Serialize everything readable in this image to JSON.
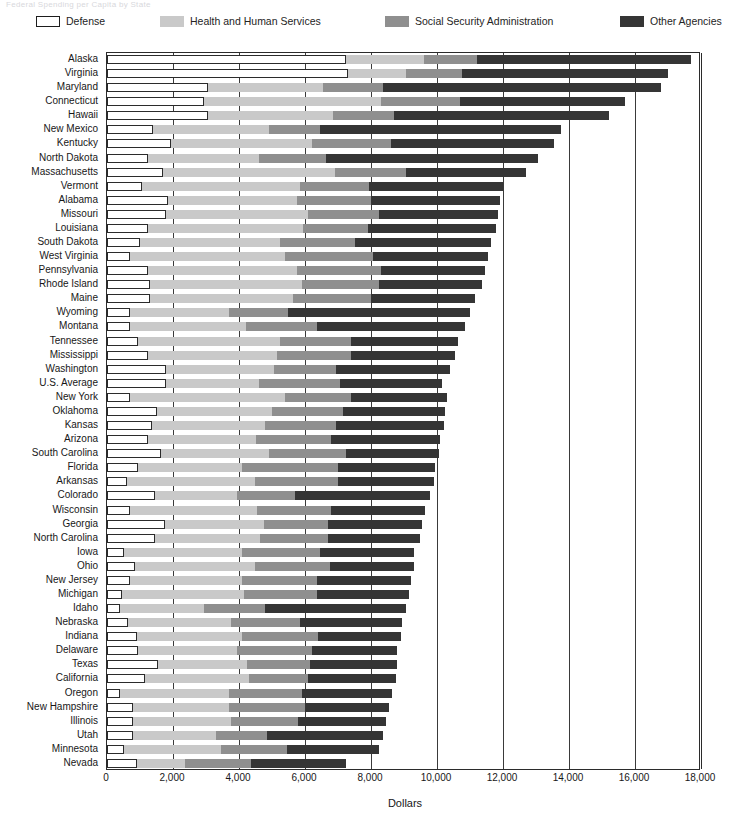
{
  "ghost_title": "Federal Spending per Capita by State",
  "legend": {
    "items": [
      {
        "label": "Defense",
        "key": "defense",
        "color": "#ffffff",
        "x": 36
      },
      {
        "label": "Health and Human Services",
        "key": "hhs",
        "color": "#c9c9c9",
        "x": 160
      },
      {
        "label": "Social Security Administration",
        "key": "ssa",
        "color": "#8f8f8f",
        "x": 385
      },
      {
        "label": "Other Agencies",
        "key": "other",
        "color": "#353535",
        "x": 620
      }
    ]
  },
  "chart_data": {
    "type": "bar",
    "orientation": "horizontal",
    "stacked": true,
    "title": "",
    "xlabel": "Dollars",
    "ylabel": "",
    "xlim": [
      0,
      18000
    ],
    "xticks": [
      0,
      2000,
      4000,
      6000,
      8000,
      10000,
      12000,
      14000,
      16000,
      18000
    ],
    "xtick_labels": [
      "0",
      "2,000",
      "4,000",
      "6,000",
      "8,000",
      "10,000",
      "12,000",
      "14,000",
      "16,000",
      "18,000"
    ],
    "grid": "vertical",
    "legend_position": "top",
    "series": [
      {
        "name": "Defense",
        "color": "#ffffff"
      },
      {
        "name": "Health and Human Services",
        "color": "#c9c9c9"
      },
      {
        "name": "Social Security Administration",
        "color": "#8f8f8f"
      },
      {
        "name": "Other Agencies",
        "color": "#353535"
      }
    ],
    "categories": [
      "Alaska",
      "Virginia",
      "Maryland",
      "Connecticut",
      "Hawaii",
      "New Mexico",
      "Kentucky",
      "North Dakota",
      "Massachusetts",
      "Vermont",
      "Alabama",
      "Missouri",
      "Louisiana",
      "South Dakota",
      "West Virginia",
      "Pennsylvania",
      "Rhode Island",
      "Maine",
      "Wyoming",
      "Montana",
      "Tennessee",
      "Mississippi",
      "Washington",
      "U.S. Average",
      "New York",
      "Oklahoma",
      "Kansas",
      "Arizona",
      "South Carolina",
      "Florida",
      "Arkansas",
      "Colorado",
      "Wisconsin",
      "Georgia",
      "North Carolina",
      "Iowa",
      "Ohio",
      "New Jersey",
      "Michigan",
      "Idaho",
      "Nebraska",
      "Indiana",
      "Delaware",
      "Texas",
      "California",
      "Oregon",
      "New Hampshire",
      "Illinois",
      "Utah",
      "Minnesota",
      "Nevada"
    ],
    "rows": [
      {
        "state": "Alaska",
        "defense": 7250,
        "hhs": 2350,
        "ssa": 1600,
        "other": 6500,
        "total": 17700
      },
      {
        "state": "Virginia",
        "defense": 7300,
        "hhs": 1750,
        "ssa": 1700,
        "other": 6250,
        "total": 17000
      },
      {
        "state": "Maryland",
        "defense": 3050,
        "hhs": 3500,
        "ssa": 1800,
        "other": 8450,
        "total": 16800
      },
      {
        "state": "Connecticut",
        "defense": 2950,
        "hhs": 5350,
        "ssa": 2400,
        "other": 5000,
        "total": 15700
      },
      {
        "state": "Hawaii",
        "defense": 3050,
        "hhs": 3800,
        "ssa": 1850,
        "other": 6500,
        "total": 15200
      },
      {
        "state": "New Mexico",
        "defense": 1400,
        "hhs": 3500,
        "ssa": 1550,
        "other": 7300,
        "total": 13750
      },
      {
        "state": "Kentucky",
        "defense": 1950,
        "hhs": 4250,
        "ssa": 2400,
        "other": 4950,
        "total": 13550
      },
      {
        "state": "North Dakota",
        "defense": 1250,
        "hhs": 3350,
        "ssa": 2050,
        "other": 6400,
        "total": 13050
      },
      {
        "state": "Massachusetts",
        "defense": 1700,
        "hhs": 5200,
        "ssa": 2150,
        "other": 3650,
        "total": 12700
      },
      {
        "state": "Vermont",
        "defense": 1050,
        "hhs": 4800,
        "ssa": 2100,
        "other": 4050,
        "total": 12000
      },
      {
        "state": "Alabama",
        "defense": 1850,
        "hhs": 3900,
        "ssa": 2250,
        "other": 3900,
        "total": 11900
      },
      {
        "state": "Missouri",
        "defense": 1800,
        "hhs": 4300,
        "ssa": 2150,
        "other": 3600,
        "total": 11850
      },
      {
        "state": "Louisiana",
        "defense": 1250,
        "hhs": 4700,
        "ssa": 1950,
        "other": 3900,
        "total": 11800
      },
      {
        "state": "South Dakota",
        "defense": 1000,
        "hhs": 4250,
        "ssa": 2250,
        "other": 4150,
        "total": 11650
      },
      {
        "state": "West Virginia",
        "defense": 700,
        "hhs": 4700,
        "ssa": 2650,
        "other": 3500,
        "total": 11550
      },
      {
        "state": "Pennsylvania",
        "defense": 1250,
        "hhs": 4500,
        "ssa": 2550,
        "other": 3150,
        "total": 11450
      },
      {
        "state": "Rhode Island",
        "defense": 1300,
        "hhs": 4600,
        "ssa": 2350,
        "other": 3100,
        "total": 11350
      },
      {
        "state": "Maine",
        "defense": 1300,
        "hhs": 4350,
        "ssa": 2350,
        "other": 3150,
        "total": 11150
      },
      {
        "state": "Wyoming",
        "defense": 700,
        "hhs": 3000,
        "ssa": 1800,
        "other": 5500,
        "total": 11000
      },
      {
        "state": "Montana",
        "defense": 700,
        "hhs": 3500,
        "ssa": 2150,
        "other": 4500,
        "total": 10850
      },
      {
        "state": "Tennessee",
        "defense": 950,
        "hhs": 4300,
        "ssa": 2150,
        "other": 3250,
        "total": 10650
      },
      {
        "state": "Mississippi",
        "defense": 1250,
        "hhs": 3900,
        "ssa": 2250,
        "other": 3150,
        "total": 10550
      },
      {
        "state": "Washington",
        "defense": 1800,
        "hhs": 3250,
        "ssa": 1900,
        "other": 3450,
        "total": 10400
      },
      {
        "state": "U.S. Average",
        "defense": 1800,
        "hhs": 2800,
        "ssa": 2450,
        "other": 3100,
        "total": 10150
      },
      {
        "state": "New York",
        "defense": 700,
        "hhs": 4700,
        "ssa": 2000,
        "other": 2900,
        "total": 10300
      },
      {
        "state": "Oklahoma",
        "defense": 1500,
        "hhs": 3500,
        "ssa": 2150,
        "other": 3100,
        "total": 10250
      },
      {
        "state": "Kansas",
        "defense": 1350,
        "hhs": 3450,
        "ssa": 2150,
        "other": 3250,
        "total": 10200
      },
      {
        "state": "Arizona",
        "defense": 1250,
        "hhs": 3250,
        "ssa": 2300,
        "other": 3300,
        "total": 10100
      },
      {
        "state": "South Carolina",
        "defense": 1650,
        "hhs": 3250,
        "ssa": 2350,
        "other": 2800,
        "total": 10050
      },
      {
        "state": "Florida",
        "defense": 950,
        "hhs": 3150,
        "ssa": 2900,
        "other": 2950,
        "total": 9950
      },
      {
        "state": "Arkansas",
        "defense": 600,
        "hhs": 3900,
        "ssa": 2500,
        "other": 2900,
        "total": 9900
      },
      {
        "state": "Colorado",
        "defense": 1450,
        "hhs": 2500,
        "ssa": 1750,
        "other": 4100,
        "total": 9800
      },
      {
        "state": "Wisconsin",
        "defense": 700,
        "hhs": 3850,
        "ssa": 2250,
        "other": 2850,
        "total": 9650
      },
      {
        "state": "Georgia",
        "defense": 1750,
        "hhs": 3000,
        "ssa": 1950,
        "other": 2850,
        "total": 9550
      },
      {
        "state": "North Carolina",
        "defense": 1450,
        "hhs": 3200,
        "ssa": 2050,
        "other": 2800,
        "total": 9500
      },
      {
        "state": "Iowa",
        "defense": 500,
        "hhs": 3600,
        "ssa": 2350,
        "other": 2850,
        "total": 9300
      },
      {
        "state": "Ohio",
        "defense": 850,
        "hhs": 3650,
        "ssa": 2250,
        "other": 2550,
        "total": 9300
      },
      {
        "state": "New Jersey",
        "defense": 700,
        "hhs": 3400,
        "ssa": 2250,
        "other": 2850,
        "total": 9200
      },
      {
        "state": "Michigan",
        "defense": 450,
        "hhs": 3700,
        "ssa": 2200,
        "other": 2800,
        "total": 9150
      },
      {
        "state": "Idaho",
        "defense": 400,
        "hhs": 2550,
        "ssa": 1850,
        "other": 4250,
        "total": 9050
      },
      {
        "state": "Nebraska",
        "defense": 650,
        "hhs": 3100,
        "ssa": 2100,
        "other": 3100,
        "total": 8950
      },
      {
        "state": "Indiana",
        "defense": 900,
        "hhs": 3200,
        "ssa": 2300,
        "other": 2500,
        "total": 8900
      },
      {
        "state": "Delaware",
        "defense": 950,
        "hhs": 3000,
        "ssa": 2250,
        "other": 2600,
        "total": 8800
      },
      {
        "state": "Texas",
        "defense": 1550,
        "hhs": 2700,
        "ssa": 1900,
        "other": 2650,
        "total": 8800
      },
      {
        "state": "California",
        "defense": 1150,
        "hhs": 3150,
        "ssa": 1800,
        "other": 2650,
        "total": 8750
      },
      {
        "state": "Oregon",
        "defense": 400,
        "hhs": 3300,
        "ssa": 2200,
        "other": 2750,
        "total": 8650
      },
      {
        "state": "New Hampshire",
        "defense": 800,
        "hhs": 2900,
        "ssa": 2300,
        "other": 2550,
        "total": 8550
      },
      {
        "state": "Illinois",
        "defense": 800,
        "hhs": 2950,
        "ssa": 2050,
        "other": 2650,
        "total": 8450
      },
      {
        "state": "Utah",
        "defense": 800,
        "hhs": 2500,
        "ssa": 1550,
        "other": 3500,
        "total": 8350
      },
      {
        "state": "Minnesota",
        "defense": 500,
        "hhs": 2950,
        "ssa": 2000,
        "other": 2800,
        "total": 8250
      },
      {
        "state": "Nevada",
        "defense": 900,
        "hhs": 1450,
        "ssa": 2000,
        "other": 2900,
        "total": 7250
      }
    ]
  }
}
